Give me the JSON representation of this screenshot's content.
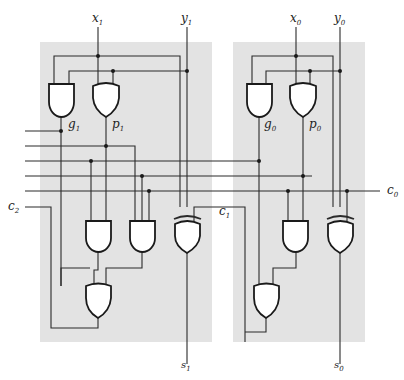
{
  "diagram": {
    "type": "two-bit carry-lookahead adder logic circuit",
    "stages": [
      {
        "name": "stage-1",
        "inputs": [
          {
            "var": "x",
            "sub": "1"
          },
          {
            "var": "y",
            "sub": "1"
          }
        ],
        "gate_labels": {
          "generate": {
            "var": "g",
            "sub": "1"
          },
          "propagate": {
            "var": "p",
            "sub": "1"
          }
        },
        "output": {
          "var": "s",
          "sub": "1"
        }
      },
      {
        "name": "stage-0",
        "inputs": [
          {
            "var": "x",
            "sub": "0"
          },
          {
            "var": "y",
            "sub": "0"
          }
        ],
        "gate_labels": {
          "generate": {
            "var": "g",
            "sub": "0"
          },
          "propagate": {
            "var": "p",
            "sub": "0"
          }
        },
        "output": {
          "var": "s",
          "sub": "0"
        }
      }
    ],
    "carries": {
      "c0": {
        "var": "c",
        "sub": "0"
      },
      "c1": {
        "var": "c",
        "sub": "1"
      },
      "c2": {
        "var": "c",
        "sub": "2"
      }
    },
    "colors": {
      "block_fill": "#e3e3e3",
      "wire": "#2a2a2a",
      "gate_fill": "#ffffff"
    }
  }
}
